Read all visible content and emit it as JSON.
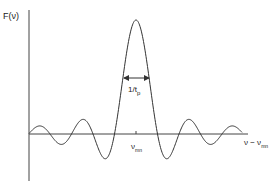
{
  "diagram": {
    "y_axis_label": {
      "main": "F(ν)"
    },
    "x_axis_label": {
      "main": "ν − ν",
      "sub": "mn"
    },
    "center_label": {
      "main": "ν",
      "sub": "mn"
    },
    "width_label": {
      "main": "1/t",
      "sub": "p"
    },
    "curve": {
      "type": "sinc",
      "description": "Sinc-shaped spectrum F(ν) centered at ν_mn with main lobe width 1/t_p and decaying side lobes",
      "center": 0,
      "zero_spacing": 1,
      "x_range": [
        -5,
        5
      ],
      "peak": 1
    },
    "colors": {
      "line": "#333333",
      "axis": "#444444",
      "text": "#222222"
    }
  }
}
